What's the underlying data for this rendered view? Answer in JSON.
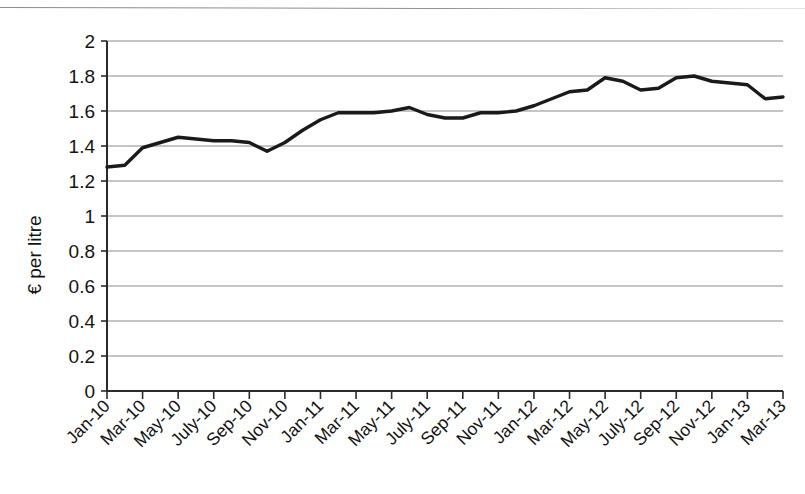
{
  "figure": {
    "background_color": "#ffffff",
    "top_rule_color": "#8d8d8d",
    "has_top_rule": true
  },
  "chart_data": {
    "type": "line",
    "title": "",
    "subtitle": "",
    "xlabel": "",
    "ylabel": "€ per litre",
    "ylim": [
      0,
      2
    ],
    "ytick_labels": [
      "0",
      "0.2",
      "0.4",
      "0.6",
      "0.8",
      "1",
      "1.2",
      "1.4",
      "1.6",
      "1.8",
      "2"
    ],
    "ytick_values": [
      0,
      0.2,
      0.4,
      0.6,
      0.8,
      1,
      1.2,
      1.4,
      1.6,
      1.8,
      2
    ],
    "grid": "horizontal",
    "grid_color": "#8c8c8c",
    "legend": "none",
    "legend_position": "none",
    "line_color": "#1a1a1a",
    "line_width": 3.4,
    "xtick_labels": [
      "Jan-10",
      "Mar-10",
      "May-10",
      "July-10",
      "Sep-10",
      "Nov-10",
      "Jan-11",
      "Mar-11",
      "May-11",
      "July-11",
      "Sep-11",
      "Nov-11",
      "Jan-12",
      "Mar-12",
      "May-12",
      "July-12",
      "Sep-12",
      "Nov-12",
      "Jan-13",
      "Mar-13"
    ],
    "xtick_label_rotation": -45,
    "xtick_interval_months": 2,
    "x": [
      "Jan-10",
      "Feb-10",
      "Mar-10",
      "Apr-10",
      "May-10",
      "June-10",
      "July-10",
      "Aug-10",
      "Sep-10",
      "Oct-10",
      "Nov-10",
      "Dec-10",
      "Jan-11",
      "Feb-11",
      "Mar-11",
      "Apr-11",
      "May-11",
      "June-11",
      "July-11",
      "Aug-11",
      "Sep-11",
      "Oct-11",
      "Nov-11",
      "Dec-11",
      "Jan-12",
      "Feb-12",
      "Mar-12",
      "Apr-12",
      "May-12",
      "June-12",
      "July-12",
      "Aug-12",
      "Sep-12",
      "Oct-12",
      "Nov-12",
      "Dec-12",
      "Jan-13",
      "Feb-13",
      "Mar-13"
    ],
    "values": [
      1.28,
      1.29,
      1.39,
      1.42,
      1.45,
      1.44,
      1.43,
      1.43,
      1.42,
      1.37,
      1.42,
      1.49,
      1.55,
      1.59,
      1.59,
      1.59,
      1.6,
      1.62,
      1.58,
      1.56,
      1.56,
      1.59,
      1.59,
      1.6,
      1.63,
      1.67,
      1.71,
      1.72,
      1.79,
      1.77,
      1.72,
      1.73,
      1.79,
      1.8,
      1.77,
      1.76,
      1.75,
      1.67,
      1.68
    ],
    "series": [
      {
        "name": "Petrol price",
        "values": [
          1.28,
          1.29,
          1.39,
          1.42,
          1.45,
          1.44,
          1.43,
          1.43,
          1.42,
          1.37,
          1.42,
          1.49,
          1.55,
          1.59,
          1.59,
          1.59,
          1.6,
          1.62,
          1.58,
          1.56,
          1.56,
          1.59,
          1.59,
          1.6,
          1.63,
          1.67,
          1.71,
          1.72,
          1.79,
          1.77,
          1.72,
          1.73,
          1.79,
          1.8,
          1.77,
          1.76,
          1.75,
          1.67,
          1.68
        ]
      }
    ]
  }
}
